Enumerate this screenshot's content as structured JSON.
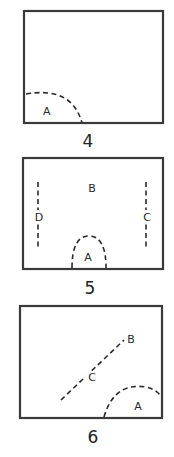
{
  "figures": [
    {
      "number": "4",
      "labels": {
        "A": "A"
      }
    },
    {
      "number": "5",
      "labels": {
        "A": "A",
        "B": "B",
        "C": "C",
        "D": "D"
      }
    },
    {
      "number": "6",
      "labels": {
        "A": "A",
        "B": "B",
        "C": "C"
      }
    }
  ],
  "colors": {
    "stroke": "#3a3a3a",
    "text": "#222222",
    "background": "#ffffff"
  }
}
